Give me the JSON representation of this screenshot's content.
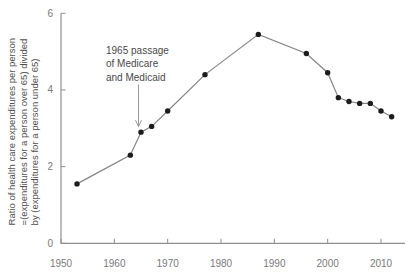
{
  "figure": {
    "y_axis_label_lines": [
      "Ratio of health care expenditures per person",
      "=(expenditures for a person over 65) divided",
      "by (expenditures for a person under 65)"
    ],
    "annotation_lines": [
      "1965 passage",
      "of Medicare",
      "and Medicaid"
    ]
  },
  "chart_data": {
    "type": "line",
    "title": "",
    "xlabel": "",
    "ylabel": "Ratio of health care expenditures per person =(expenditures for a person over 65) divided by (expenditures for a person under 65)",
    "series_name": "Expenditure ratio (person over 65 / person under 65)",
    "x": [
      1953,
      1963,
      1965,
      1967,
      1970,
      1977,
      1987,
      1996,
      2000,
      2002,
      2004,
      2006,
      2008,
      2010,
      2012
    ],
    "values": [
      1.55,
      2.3,
      2.9,
      3.05,
      3.45,
      4.4,
      5.45,
      4.95,
      4.45,
      3.8,
      3.7,
      3.65,
      3.65,
      3.45,
      3.3
    ],
    "xlim": [
      1950,
      2014.5
    ],
    "ylim": [
      0,
      6
    ],
    "x_ticks": [
      1950,
      1960,
      1970,
      1980,
      1990,
      2000,
      2010
    ],
    "y_ticks": [
      0,
      2,
      4,
      6
    ],
    "grid": false,
    "legend": "none",
    "marker": "filled-circle",
    "annotation": {
      "text": "1965 passage of Medicare and Medicaid",
      "target_x": 1965,
      "target_y": 2.9
    },
    "colors": {
      "background": "#ffffff",
      "axis": "#909090",
      "tick_labels": "#7a7a7a",
      "line": "#858585",
      "marker": "#1c1c1c",
      "annotation_text": "#4a4a4a",
      "arrow": "#9a9a9a"
    }
  }
}
